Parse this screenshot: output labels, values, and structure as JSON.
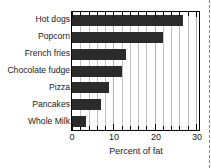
{
  "chart_data": {
    "type": "bar",
    "orientation": "horizontal",
    "title": "",
    "xlabel": "Percent of fat",
    "ylabel": "",
    "categories": [
      "Hot dogs",
      "Popcorn",
      "French fries",
      "Chocolate fudge",
      "Pizza",
      "Pancakes",
      "Whole Milk"
    ],
    "values": [
      27,
      22,
      13,
      12,
      9,
      7,
      3.4
    ],
    "xlim": [
      0,
      30.8
    ],
    "xticks": [
      0,
      10,
      20,
      30
    ],
    "xtick_labels": [
      "0",
      "10",
      "20",
      "30"
    ],
    "minor_tick_step": 2,
    "grid": true,
    "grid_axis": "x",
    "legend": "none",
    "bar_color": "#2b2b2b",
    "grid_color": "#c2c2c2",
    "axis_color": "#000000"
  },
  "figure": {
    "background": "#ffffff",
    "crop_border": "dashed"
  }
}
